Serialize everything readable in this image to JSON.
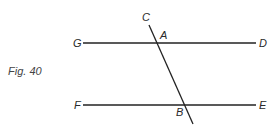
{
  "figure": {
    "caption": "Fig. 40",
    "lines": [
      {
        "name": "GD",
        "from": "G",
        "to": "D",
        "x1": 83,
        "y1": 43,
        "x2": 256,
        "y2": 43
      },
      {
        "name": "FE",
        "from": "F",
        "to": "E",
        "x1": 83,
        "y1": 105,
        "x2": 256,
        "y2": 105
      },
      {
        "name": "transversal",
        "from": "C",
        "to": "",
        "x1": 149,
        "y1": 25,
        "x2": 193,
        "y2": 124
      }
    ],
    "points": {
      "G": "G",
      "D": "D",
      "F": "F",
      "E": "E",
      "C": "C",
      "A": "A",
      "B": "B"
    },
    "colors": {
      "line": "#222222",
      "label": "#2a2a2a",
      "background": "#ffffff"
    }
  }
}
